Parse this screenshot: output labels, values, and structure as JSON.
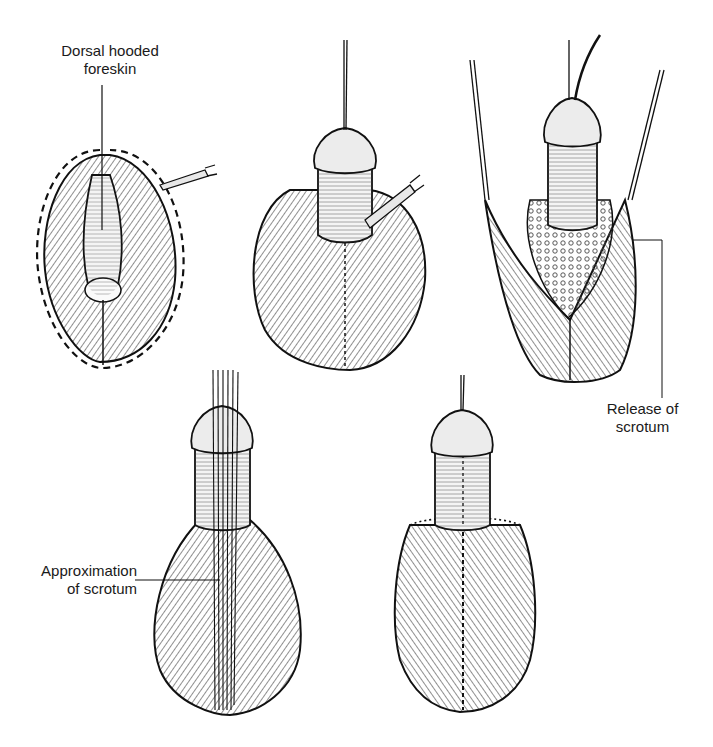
{
  "figure": {
    "panels": [
      {
        "id": "panel-1",
        "description": "Dorsal hooded foreskin with dashed incision outline and forceps"
      },
      {
        "id": "panel-2",
        "description": "Penile shaft exposed with forceps, suture traction at glans"
      },
      {
        "id": "panel-3",
        "description": "Scrotal flaps retracted with sutures"
      },
      {
        "id": "panel-4",
        "description": "Approximation of scrotum with multiple sutures"
      },
      {
        "id": "panel-5",
        "description": "Completed repair with sutured midline"
      }
    ],
    "labels": {
      "dorsal_hooded_foreskin": [
        "Dorsal hooded",
        "foreskin"
      ],
      "release_of_scrotum": [
        "Release of",
        "scrotum"
      ],
      "approximation_of_scrotum": [
        "Approximation",
        "of scrotum"
      ]
    }
  }
}
